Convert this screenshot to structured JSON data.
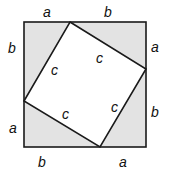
{
  "diagram": {
    "colors": {
      "outer_fill": "#e3e3e3",
      "inner_fill": "#ffffff",
      "stroke": "#1a1a1a"
    },
    "outer_square": {
      "x": 24,
      "y": 22,
      "size": 122
    },
    "inner_square": [
      [
        70,
        22
      ],
      [
        146,
        69
      ],
      [
        100,
        147
      ],
      [
        24,
        101
      ]
    ],
    "side_labels": {
      "top_left": "a",
      "top_right": "b",
      "left_top": "b",
      "left_bottom": "a",
      "right_top": "a",
      "right_bottom": "b",
      "bottom_left": "b",
      "bottom_right": "a"
    },
    "hypotenuse_labels": {
      "top": "c",
      "left": "c",
      "bottom": "c",
      "right": "c"
    }
  }
}
